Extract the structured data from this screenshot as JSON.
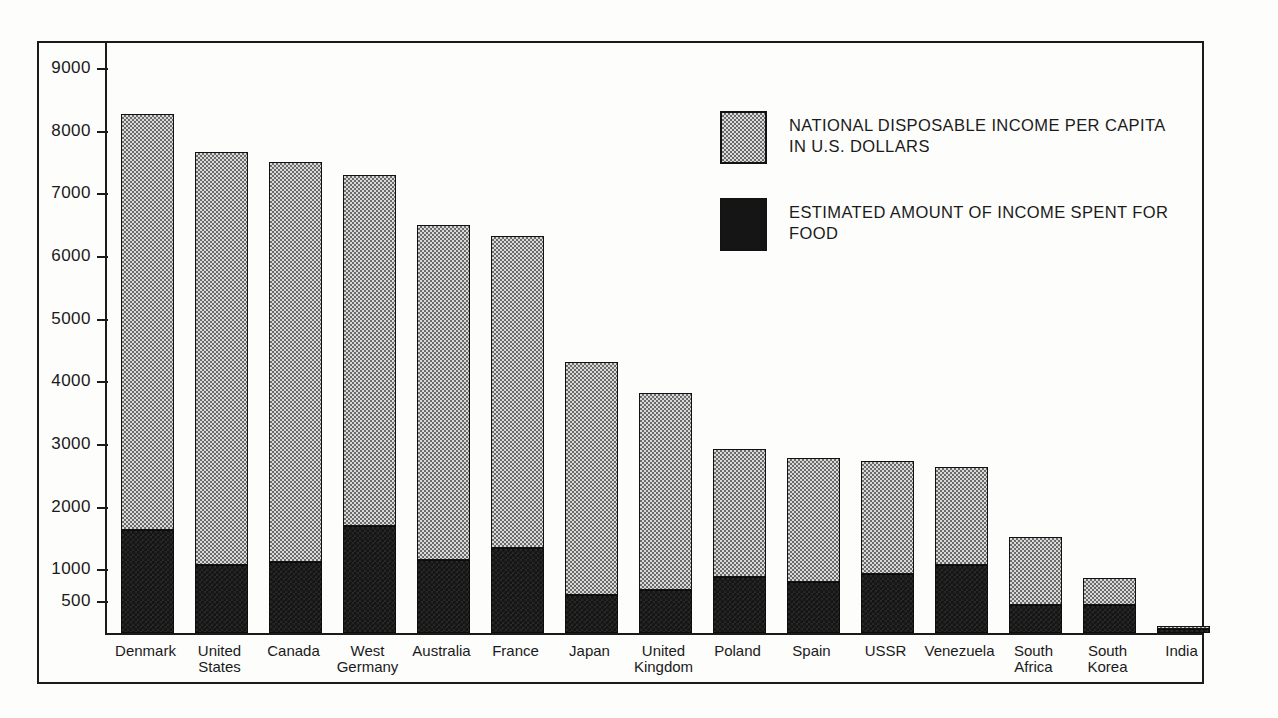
{
  "chart_data": {
    "type": "bar",
    "stacked": true,
    "title": "",
    "xlabel": "",
    "ylabel": "",
    "ylim": [
      0,
      9000
    ],
    "grid": false,
    "legend_position": "upper-right",
    "ytick_labels": [
      "9000",
      "8000",
      "7000",
      "6000",
      "5000",
      "4000",
      "3000",
      "2000",
      "1000",
      "500"
    ],
    "ytick_values": [
      9000,
      8000,
      7000,
      6000,
      5000,
      4000,
      3000,
      2000,
      1000,
      500
    ],
    "categories": [
      "Denmark",
      "United\nStates",
      "Canada",
      "West\nGermany",
      "Australia",
      "France",
      "Japan",
      "United\nKingdom",
      "Poland",
      "Spain",
      "USSR",
      "Venezuela",
      "South\nAfrica",
      "South\nKorea",
      "India"
    ],
    "series": [
      {
        "name": "NATIONAL DISPOSABLE INCOME PER CAPITA IN U.S. DOLLARS",
        "values": [
          8290,
          7680,
          7520,
          7310,
          6510,
          6330,
          4330,
          3830,
          2940,
          2800,
          2750,
          2650,
          1540,
          880,
          120
        ]
      },
      {
        "name": "ESTIMATED AMOUNT OF INCOME SPENT FOR FOOD",
        "values": [
          1650,
          1080,
          1130,
          1710,
          1160,
          1360,
          610,
          680,
          900,
          820,
          940,
          1080,
          450,
          450,
          60
        ]
      }
    ]
  },
  "legend": {
    "items": [
      {
        "swatch": "stipple-light",
        "label": "NATIONAL DISPOSABLE INCOME PER CAPITA\nIN U.S. DOLLARS"
      },
      {
        "swatch": "solid-black",
        "label": "ESTIMATED AMOUNT OF INCOME SPENT FOR\nFOOD"
      }
    ]
  },
  "colors": {
    "income_fill": "#d9d9d9",
    "food_fill": "#141414",
    "frame": "#1b1b1b",
    "background": "#fdfdfc"
  }
}
